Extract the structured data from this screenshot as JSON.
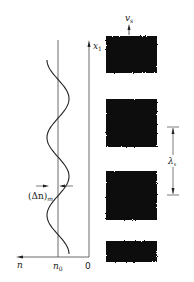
{
  "figure": {
    "left_panel": {
      "description": "refractive index profile n(x1)",
      "labels": {
        "x_axis": "n",
        "n0": "n",
        "n0_sub": "0",
        "zero": "0",
        "vertical_axis": "x",
        "vertical_axis_sub": "1",
        "modulation": "(Δn)",
        "modulation_sub": "m"
      },
      "curve_periods": 2.5
    },
    "right_panel": {
      "description": "grating fringe pattern",
      "labels": {
        "velocity": "v",
        "velocity_sub": "s",
        "wavelength": "λ",
        "wavelength_sub": "s"
      },
      "band_count": 4,
      "band_color": "#111111"
    }
  }
}
